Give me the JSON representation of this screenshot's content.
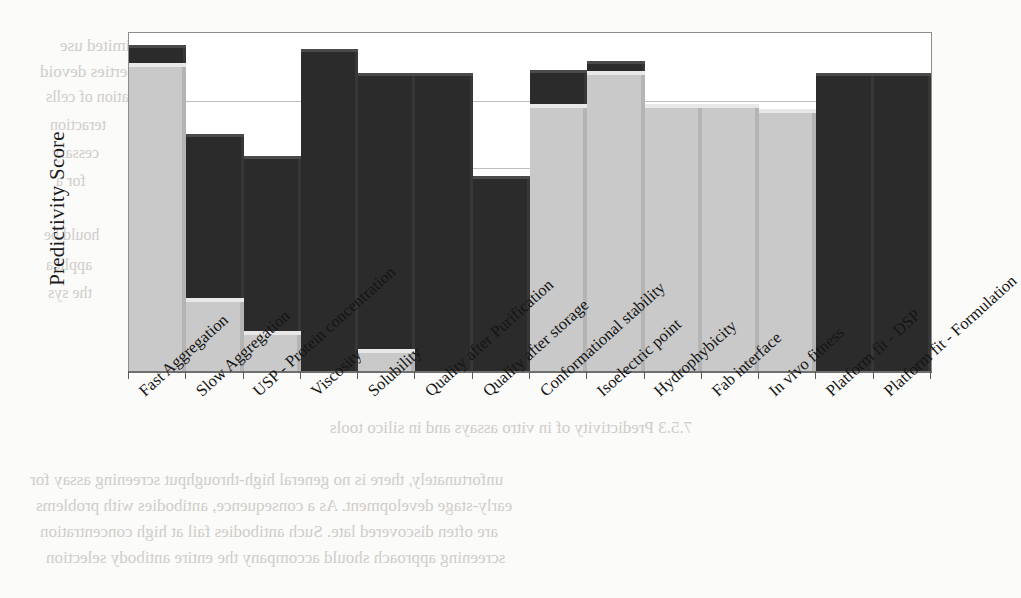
{
  "chart_data": {
    "type": "bar",
    "title": "",
    "subtitle": "",
    "xlabel": "",
    "ylabel": "Predictivity Score",
    "ylim": [
      0,
      1
    ],
    "grid": true,
    "gridlines": [
      0.2,
      0.4,
      0.6,
      0.8
    ],
    "legend": "none",
    "stacked": true,
    "bar_style": "3d-shaded stacked column",
    "categories": [
      "Fast Aggregation",
      "Slow Aggregation",
      "USP - Protein concentration",
      "Viscosity",
      "Solubility",
      "Quality after Purification",
      "Quality after storage",
      "Conformational stability",
      "Isoelectric point",
      "Hydrophybicity",
      "Fab interface",
      "In vivo fitness",
      "Platform fit - DSP",
      "Platform fit - Formulation"
    ],
    "series": [
      {
        "name": "light-segment",
        "color": "#c9c9c9",
        "values": [
          0.912,
          0.216,
          0.118,
          0.0,
          0.065,
          0.0,
          0.0,
          0.79,
          0.888,
          0.79,
          0.79,
          0.775,
          0.0,
          0.0
        ]
      },
      {
        "name": "dark-segment",
        "color": "#2b2b2b",
        "values": [
          0.053,
          0.485,
          0.518,
          0.953,
          0.817,
          0.882,
          0.577,
          0.101,
          0.03,
          0.0,
          0.0,
          0.0,
          0.882,
          0.882
        ]
      }
    ],
    "totals": [
      0.965,
      0.701,
      0.636,
      0.953,
      0.882,
      0.882,
      0.577,
      0.891,
      0.918,
      0.79,
      0.79,
      0.775,
      0.882,
      0.882
    ],
    "axis_colors": {
      "frame": "#8d8d8d",
      "grid": "#bdbdbd",
      "baseline": "#6f6f6f"
    }
  },
  "bleed_text": [
    {
      "text": "but the resulting assay may be of limited use",
      "x": 60,
      "y": 36,
      "size": 17
    },
    {
      "text": "screening these biophysical properties devoid",
      "x": 40,
      "y": 62,
      "size": 17
    },
    {
      "text": "stability and concentration of cells",
      "x": 46,
      "y": 88,
      "size": 16
    },
    {
      "text": "teraction",
      "x": 50,
      "y": 116,
      "size": 16
    },
    {
      "text": "cessary",
      "x": 52,
      "y": 144,
      "size": 16
    },
    {
      "text": "for a",
      "x": 56,
      "y": 172,
      "size": 16
    },
    {
      "text": "hould be",
      "x": 44,
      "y": 226,
      "size": 16
    },
    {
      "text": "applica",
      "x": 46,
      "y": 256,
      "size": 16
    },
    {
      "text": "the sys",
      "x": 48,
      "y": 284,
      "size": 16
    },
    {
      "text": "7.5.3 Predictivity of in vitro assays and in silico tools",
      "x": 330,
      "y": 418,
      "size": 17
    },
    {
      "text": "unfortunately, there is no general high-throughput screening assay for",
      "x": 30,
      "y": 470,
      "size": 17
    },
    {
      "text": "early-stage development. As a consequence, antibodies with problems",
      "x": 36,
      "y": 496,
      "size": 17
    },
    {
      "text": "are often discovered late. Such antibodies fail at high concentration",
      "x": 40,
      "y": 522,
      "size": 17
    },
    {
      "text": "screening approach should accompany the entire antibody selection",
      "x": 46,
      "y": 548,
      "size": 17
    }
  ]
}
